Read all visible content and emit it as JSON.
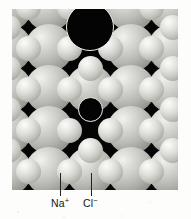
{
  "figure": {
    "kind": "sodium-chloride-crystal-lattice-diagram",
    "panel": {
      "background_color": "#050505",
      "x": 12,
      "y": 9,
      "width": 166,
      "height": 181
    },
    "lattice": {
      "description": "Face-centred cubic rock-salt lattice viewed along a cube face; large chloride spheres alternate with small sodium spheres in a checkerboard arrangement.",
      "pitch_px": 41,
      "anion_radius_px": 24,
      "cation_radius_px": 12.5,
      "anion_color": "#b8b8b3",
      "cation_color": "#dedeDA",
      "anions": [
        {
          "cx": -4,
          "cy": -2,
          "r": 24
        },
        {
          "cx": 37,
          "cy": -2,
          "r": 24
        },
        {
          "cx": 78,
          "cy": -2,
          "r": 24
        },
        {
          "cx": 119,
          "cy": -2,
          "r": 24
        },
        {
          "cx": 160,
          "cy": -2,
          "r": 24
        },
        {
          "cx": -4,
          "cy": 39,
          "r": 24
        },
        {
          "cx": 37,
          "cy": 39,
          "r": 24
        },
        {
          "cx": 119,
          "cy": 39,
          "r": 24
        },
        {
          "cx": 160,
          "cy": 39,
          "r": 24
        },
        {
          "cx": -4,
          "cy": 80,
          "r": 24
        },
        {
          "cx": 37,
          "cy": 80,
          "r": 24
        },
        {
          "cx": 78,
          "cy": 80,
          "r": 24
        },
        {
          "cx": 119,
          "cy": 80,
          "r": 24
        },
        {
          "cx": 160,
          "cy": 80,
          "r": 24
        },
        {
          "cx": -4,
          "cy": 121,
          "r": 24
        },
        {
          "cx": 37,
          "cy": 121,
          "r": 24
        },
        {
          "cx": 119,
          "cy": 121,
          "r": 24
        },
        {
          "cx": 160,
          "cy": 121,
          "r": 24
        },
        {
          "cx": -4,
          "cy": 162,
          "r": 24
        },
        {
          "cx": 37,
          "cy": 162,
          "r": 24
        },
        {
          "cx": 78,
          "cy": 162,
          "r": 24
        },
        {
          "cx": 119,
          "cy": 162,
          "r": 24
        },
        {
          "cx": 160,
          "cy": 162,
          "r": 24
        }
      ],
      "cations": [
        {
          "cx": 16,
          "cy": -2,
          "r": 12.5
        },
        {
          "cx": 57,
          "cy": -2,
          "r": 12.5
        },
        {
          "cx": 139,
          "cy": -2,
          "r": 12.5
        },
        {
          "cx": 180,
          "cy": -2,
          "r": 12.5
        },
        {
          "cx": -4,
          "cy": 18,
          "r": 12.5
        },
        {
          "cx": 78,
          "cy": 18,
          "r": 12.5
        },
        {
          "cx": 160,
          "cy": 18,
          "r": 12.5
        },
        {
          "cx": 16,
          "cy": 39,
          "r": 12.5
        },
        {
          "cx": 57,
          "cy": 39,
          "r": 12.5
        },
        {
          "cx": 98,
          "cy": 39,
          "r": 12.5
        },
        {
          "cx": 139,
          "cy": 39,
          "r": 12.5
        },
        {
          "cx": 180,
          "cy": 39,
          "r": 12.5
        },
        {
          "cx": -4,
          "cy": 59,
          "r": 12.5
        },
        {
          "cx": 78,
          "cy": 59,
          "r": 12.5
        },
        {
          "cx": 160,
          "cy": 59,
          "r": 12.5
        },
        {
          "cx": 16,
          "cy": 80,
          "r": 12.5
        },
        {
          "cx": 57,
          "cy": 80,
          "r": 12.5
        },
        {
          "cx": 98,
          "cy": 80,
          "r": 12.5
        },
        {
          "cx": 139,
          "cy": 80,
          "r": 12.5
        },
        {
          "cx": 180,
          "cy": 80,
          "r": 12.5
        },
        {
          "cx": -4,
          "cy": 100,
          "r": 12.5
        },
        {
          "cx": 160,
          "cy": 100,
          "r": 12.5
        },
        {
          "cx": 16,
          "cy": 121,
          "r": 12.5
        },
        {
          "cx": 57,
          "cy": 121,
          "r": 12.5
        },
        {
          "cx": 98,
          "cy": 121,
          "r": 12.5
        },
        {
          "cx": 139,
          "cy": 121,
          "r": 12.5
        },
        {
          "cx": 180,
          "cy": 121,
          "r": 12.5
        },
        {
          "cx": -4,
          "cy": 141,
          "r": 12.5
        },
        {
          "cx": 78,
          "cy": 141,
          "r": 12.5
        },
        {
          "cx": 160,
          "cy": 141,
          "r": 12.5
        },
        {
          "cx": 16,
          "cy": 162,
          "r": 12.5
        },
        {
          "cx": 57,
          "cy": 162,
          "r": 12.5
        },
        {
          "cx": 98,
          "cy": 162,
          "r": 12.5
        },
        {
          "cx": 139,
          "cy": 162,
          "r": 12.5
        },
        {
          "cx": 180,
          "cy": 162,
          "r": 12.5
        }
      ],
      "outlined_sites": [
        {
          "name": "vacant-anion-site",
          "cx": 78,
          "cy": 18,
          "r": 24,
          "outline_color": "#ededea"
        },
        {
          "name": "vacant-cation-site",
          "cx": 78,
          "cy": 100,
          "r": 12.5,
          "outline_color": "#ededea"
        }
      ]
    },
    "callouts": [
      {
        "name": "sodium-ion",
        "label": "Na",
        "charge": "+",
        "leader": {
          "x": 60,
          "y_top": 173,
          "y_bottom": 196
        },
        "label_x": 51,
        "label_y": 198
      },
      {
        "name": "chloride-ion",
        "label": "Cl",
        "charge": "−",
        "leader": {
          "x": 91,
          "y_top": 173,
          "y_bottom": 196
        },
        "label_x": 83,
        "label_y": 198
      }
    ]
  }
}
